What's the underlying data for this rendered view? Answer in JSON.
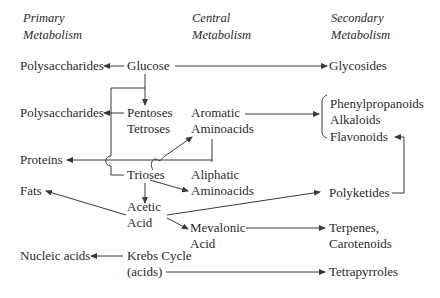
{
  "headers": {
    "primary": [
      "Primary",
      "Metabolism"
    ],
    "central": [
      "Central",
      "Metabolism"
    ],
    "secondary": [
      "Secondary",
      "Metabolism"
    ]
  },
  "primary": {
    "polysaccharides_1": "Polysaccharides",
    "polysaccharides_2": "Polysaccharides",
    "proteins": "Proteins",
    "fats": "Fats",
    "nucleic_acids": "Nucleic acids"
  },
  "central": {
    "glucose": "Glucose",
    "pentoses": "Pentoses",
    "tetroses": "Tetroses",
    "aromatic": "Aromatic",
    "aromatic_aminoacids": "Aminoacids",
    "trioses": "Trioses",
    "aliphatic": "Aliphatic",
    "aliphatic_aminoacids": "Aminoacids",
    "acetic": "Acetic",
    "acetic_acid": "Acid",
    "mevalonic": "Mevalonic",
    "mevalonic_acid": "Acid",
    "krebs": "Krebs Cycle",
    "krebs_acids": "(acids)"
  },
  "secondary": {
    "glycosides": "Glycosides",
    "phenylpropanoids": "Phenylpropanoids",
    "alkaloids": "Alkaloids",
    "flavonoids": "Flavonoids",
    "polyketides": "Polyketides",
    "terpenes": "Terpenes,",
    "carotenoids": "Carotenoids",
    "tetrapyrroles": "Tetrapyrroles"
  },
  "edges": [
    {
      "from": "Glucose",
      "to": "Polysaccharides"
    },
    {
      "from": "Glucose",
      "to": "Glycosides"
    },
    {
      "from": "Glucose",
      "to": "Pentoses/Tetroses"
    },
    {
      "from": "Pentoses/Tetroses",
      "to": "Polysaccharides"
    },
    {
      "from": "Glucose",
      "to": "Trioses"
    },
    {
      "from": "Trioses",
      "to": "Aromatic Aminoacids"
    },
    {
      "from": "Aromatic/Aliphatic Aminoacids",
      "to": "Proteins"
    },
    {
      "from": "Aromatic Aminoacids",
      "to": "Phenylpropanoids/Alkaloids/Flavonoids"
    },
    {
      "from": "Trioses",
      "to": "Aliphatic Aminoacids"
    },
    {
      "from": "Trioses",
      "to": "Acetic Acid"
    },
    {
      "from": "Acetic Acid",
      "to": "Fats"
    },
    {
      "from": "Acetic Acid",
      "to": "Polyketides"
    },
    {
      "from": "Acetic Acid",
      "to": "Mevalonic Acid"
    },
    {
      "from": "Polyketides",
      "to": "Flavonoids"
    },
    {
      "from": "Mevalonic Acid",
      "to": "Terpenes, Carotenoids"
    },
    {
      "from": "Krebs Cycle",
      "to": "Nucleic acids"
    },
    {
      "from": "Krebs Cycle (acids)",
      "to": "Tetrapyrroles"
    }
  ]
}
